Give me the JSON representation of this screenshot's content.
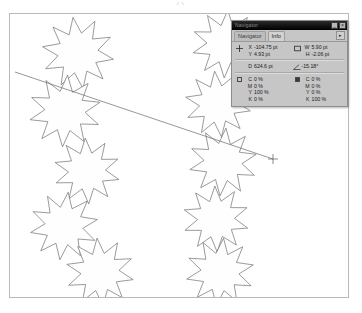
{
  "document": {
    "name": "image-canvas",
    "background": "#ffffff",
    "border_color": "#b9b9b9"
  },
  "artwork": {
    "shape_name": "ten-point-star",
    "stroke_color": "#707070",
    "fill_color": "#fefefe",
    "star_points": 10,
    "stars": [
      {
        "cx": 68,
        "cy": 39,
        "r": 36,
        "inner": 0.56,
        "rot": -8
      },
      {
        "cx": 55,
        "cy": 97,
        "r": 36,
        "inner": 0.56,
        "rot": 4
      },
      {
        "cx": 77,
        "cy": 157,
        "r": 33,
        "inner": 0.56,
        "rot": -3
      },
      {
        "cx": 54,
        "cy": 212,
        "r": 34,
        "inner": 0.56,
        "rot": 7
      },
      {
        "cx": 90,
        "cy": 258,
        "r": 34,
        "inner": 0.56,
        "rot": -5
      },
      {
        "cx": 216,
        "cy": 30,
        "r": 34,
        "inner": 0.56,
        "rot": 3
      },
      {
        "cx": 208,
        "cy": 90,
        "r": 33,
        "inner": 0.56,
        "rot": -6
      },
      {
        "cx": 213,
        "cy": 148,
        "r": 34,
        "inner": 0.56,
        "rot": 5
      },
      {
        "cx": 206,
        "cy": 205,
        "r": 33,
        "inner": 0.56,
        "rot": -2
      },
      {
        "cx": 210,
        "cy": 258,
        "r": 34,
        "inner": 0.56,
        "rot": 6
      }
    ],
    "measure_line": {
      "name": "measure-tool-line",
      "x1": 5,
      "y1": 58,
      "x2": 263,
      "y2": 145,
      "stroke_color": "#6a6a6a"
    },
    "measure_end_marker": {
      "x": 263,
      "y": 145,
      "size": 5
    }
  },
  "palette": {
    "title": "Navigator",
    "titlebar_buttons": [
      {
        "name": "minimize-button",
        "glyph": "_"
      },
      {
        "name": "close-button",
        "glyph": "×"
      }
    ],
    "menu_button_glyph": "▸",
    "tabs": [
      {
        "label": "Navigator",
        "active": false
      },
      {
        "label": "Info",
        "active": true
      }
    ],
    "info": {
      "pointer_icon": "crosshair-icon",
      "marquee_icon": "rectangle-marquee-icon",
      "angle_icon": "angle-icon",
      "coordinates": [
        {
          "label": "X",
          "value": "-104.75 pt"
        },
        {
          "label": "Y",
          "value": "4.93 pt"
        }
      ],
      "dimensions": [
        {
          "label": "W",
          "value": "5.90 pt"
        },
        {
          "label": "H",
          "value": "-2.06 pt"
        }
      ],
      "distance": {
        "label": "D",
        "value": "624.6 pt"
      },
      "angle": {
        "label": "A",
        "value": "-15.18°"
      },
      "color_left": {
        "swatch_name": "foreground-color-swatch",
        "swatch_filled": false,
        "channels": [
          {
            "label": "C",
            "value": "0 %"
          },
          {
            "label": "M",
            "value": "0 %"
          },
          {
            "label": "Y",
            "value": "100 %"
          },
          {
            "label": "K",
            "value": "0 %"
          }
        ]
      },
      "color_right": {
        "swatch_name": "background-color-swatch",
        "swatch_filled": true,
        "channels": [
          {
            "label": "C",
            "value": "0 %"
          },
          {
            "label": "M",
            "value": "0 %"
          },
          {
            "label": "Y",
            "value": "0 %"
          },
          {
            "label": "K",
            "value": "100 %"
          }
        ]
      }
    }
  }
}
